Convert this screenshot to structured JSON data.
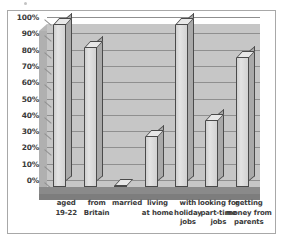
{
  "chart_data": {
    "type": "bar",
    "title": "",
    "subtitle": "",
    "xlabel": "",
    "ylabel": "",
    "ylim": [
      0,
      100
    ],
    "y_tick_step": 10,
    "grid": true,
    "legend": "none",
    "style": "3d-bar-grayscale",
    "categories": [
      "aged 19-22",
      "from Britain",
      "married",
      "living at home",
      "with holiday jobs",
      "looking for part-time jobs",
      "getting money from parents"
    ],
    "category_lines": [
      [
        "aged",
        "19-22"
      ],
      [
        "from",
        "Britain"
      ],
      [
        "married"
      ],
      [
        "living",
        "at home"
      ],
      [
        "with",
        "holiday",
        "jobs"
      ],
      [
        "looking for",
        "part-time",
        "jobs"
      ],
      [
        "getting",
        "money from",
        "parents"
      ]
    ],
    "values": [
      100,
      86,
      1,
      31,
      100,
      41,
      80
    ],
    "value_unit": "%",
    "ytick_labels": [
      "100%",
      "90%",
      "80%",
      "70%",
      "60%",
      "50%",
      "40%",
      "30%",
      "20%",
      "10%",
      "0%"
    ],
    "ytick_values": [
      100,
      90,
      80,
      70,
      60,
      50,
      40,
      30,
      20,
      10,
      0
    ]
  },
  "colors": {
    "page_background": "#ffffff",
    "frame_border": "#a8a8a8",
    "back_wall": "#c6c6c6",
    "side_wall": "#b0b0b0",
    "floor": "#8a8a8a",
    "gridline": "#8f8f8f",
    "bar_face": "#d6d6d6",
    "bar_side": "#a9a9a9",
    "bar_top": "#e8e8e8",
    "bar_outline": "#4a4a4a",
    "text": "#3a3a3a"
  }
}
